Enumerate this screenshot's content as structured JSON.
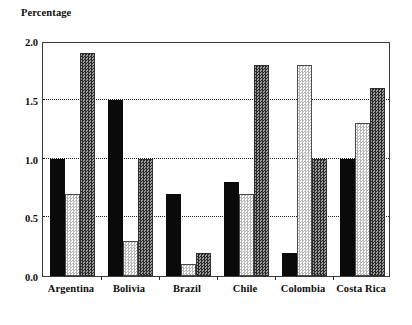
{
  "chart_data": {
    "type": "bar",
    "title": "Percentage",
    "xlabel": "",
    "ylabel": "Percentage",
    "ylim": [
      0.0,
      2.0
    ],
    "yticks": [
      "0.0",
      "0.5",
      "1.0",
      "1.5",
      "2.0"
    ],
    "ytick_values": [
      0.0,
      0.5,
      1.0,
      1.5,
      2.0
    ],
    "grid": "horizontal-dotted",
    "gridline_values": [
      0.5,
      1.0,
      1.5
    ],
    "legend": "none",
    "legend_position": "none",
    "categories": [
      "Argentina",
      "Bolivia",
      "Brazil",
      "Chile",
      "Colombia",
      "Costa Rica"
    ],
    "series": [
      {
        "name": "series-1",
        "fill": "solid-black",
        "color": "#0a0a0a",
        "values": [
          1.0,
          1.5,
          0.7,
          0.8,
          0.2,
          1.0
        ]
      },
      {
        "name": "series-2",
        "fill": "light-gray-checker",
        "color": "#b8b8b8",
        "values": [
          0.7,
          0.3,
          0.1,
          0.7,
          1.8,
          1.3
        ]
      },
      {
        "name": "series-3",
        "fill": "dark-gray-checker",
        "color": "#6e6e6e",
        "values": [
          1.9,
          1.0,
          0.2,
          1.8,
          1.0,
          1.6
        ]
      }
    ]
  },
  "colors": {
    "background": "#ffffff",
    "axis": "#3a3a3a",
    "text": "#0d0d0d",
    "gridline": "#1a1a1a"
  }
}
